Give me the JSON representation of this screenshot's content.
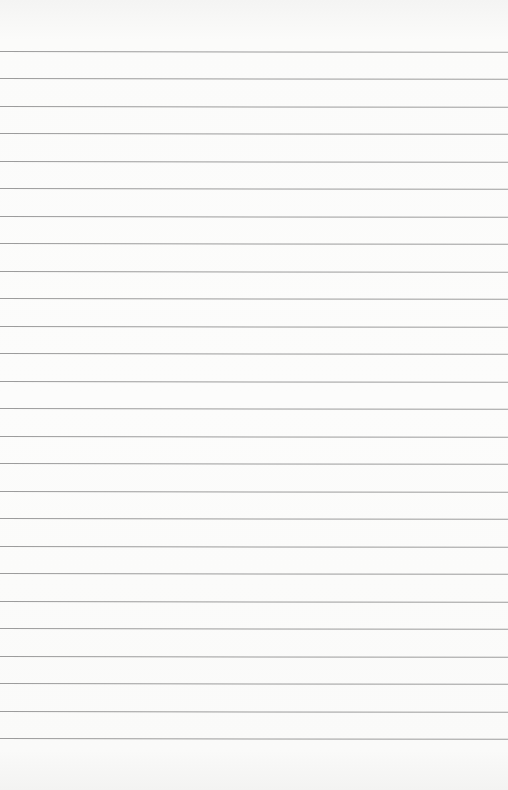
{
  "paper": {
    "type": "lined-paper",
    "background_color": "#fbfbfa",
    "line_color": "#9c9c9c",
    "line_count": 26,
    "first_line_y": 51,
    "line_spacing": 27.48
  }
}
